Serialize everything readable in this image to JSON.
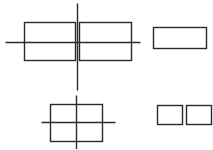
{
  "diagram": {
    "stroke_color": "#2a2a2a",
    "background": "#ffffff",
    "figures": [
      {
        "name": "split-box-with-crosshair",
        "rects": [
          {
            "x": 24,
            "y": 22,
            "w": 51,
            "h": 38
          },
          {
            "x": 79,
            "y": 22,
            "w": 52,
            "h": 38
          }
        ],
        "lines": [
          {
            "x1": 5,
            "y1": 42,
            "x2": 140,
            "y2": 42
          },
          {
            "x1": 77,
            "y1": 3,
            "x2": 77,
            "y2": 90
          }
        ]
      },
      {
        "name": "single-rectangle",
        "rects": [
          {
            "x": 153,
            "y": 27,
            "w": 53,
            "h": 21
          }
        ],
        "lines": []
      },
      {
        "name": "box-with-crosshair",
        "rects": [
          {
            "x": 50,
            "y": 104,
            "w": 52,
            "h": 37
          }
        ],
        "lines": [
          {
            "x1": 41,
            "y1": 122,
            "x2": 115,
            "y2": 122
          },
          {
            "x1": 76,
            "y1": 95,
            "x2": 76,
            "y2": 149
          }
        ]
      },
      {
        "name": "two-small-squares",
        "rects": [
          {
            "x": 157,
            "y": 105,
            "w": 25,
            "h": 19
          },
          {
            "x": 186,
            "y": 105,
            "w": 25,
            "h": 19
          }
        ],
        "lines": []
      }
    ]
  }
}
